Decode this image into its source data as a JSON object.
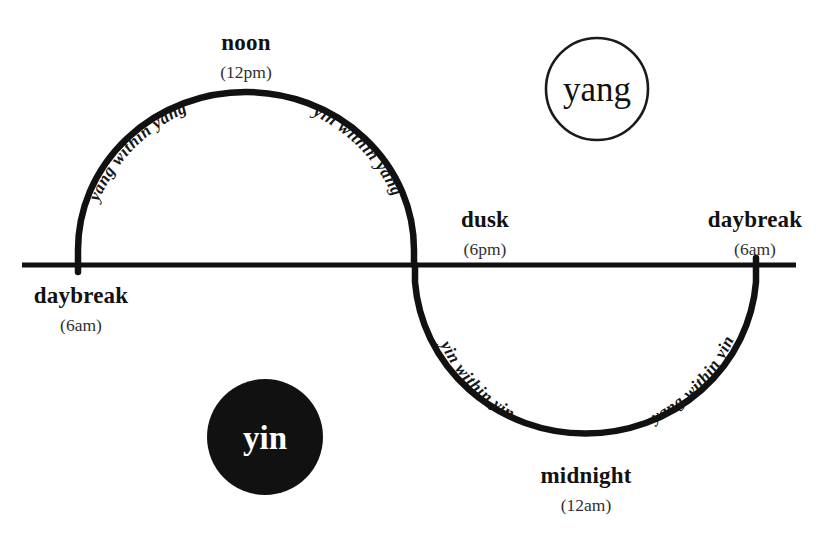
{
  "diagram": {
    "colors": {
      "stroke": "#111111",
      "background": "#ffffff",
      "yin_fill": "#111111",
      "yin_text": "#ffffff",
      "yang_fill": "#ffffff",
      "yang_text": "#111111"
    },
    "axis": {
      "name": "horizon-line",
      "x1": 22,
      "x2": 796,
      "y": 265,
      "thickness": 5
    },
    "wave": {
      "name": "sine-wave",
      "thickness": 6,
      "left_foot_x": 78,
      "crossing_x": 415,
      "right_foot_x": 756,
      "crest_y": 93,
      "trough_y": 446
    }
  },
  "time_markers": [
    {
      "key": "noon",
      "label": "noon",
      "time": "(12pm)",
      "x": 246,
      "label_y": 50,
      "time_y": 78,
      "anchor": "middle"
    },
    {
      "key": "dusk",
      "label": "dusk",
      "time": "(6pm)",
      "x": 485,
      "label_y": 227,
      "time_y": 255,
      "anchor": "middle"
    },
    {
      "key": "daybreak-right",
      "label": "daybreak",
      "time": "(6am)",
      "x": 755,
      "label_y": 227,
      "time_y": 255,
      "anchor": "middle"
    },
    {
      "key": "daybreak-left",
      "label": "daybreak",
      "time": "(6am)",
      "x": 81,
      "label_y": 303,
      "time_y": 331,
      "anchor": "middle"
    },
    {
      "key": "midnight",
      "label": "midnight",
      "time": "(12am)",
      "x": 586,
      "label_y": 483,
      "time_y": 511,
      "anchor": "middle"
    }
  ],
  "arc_captions": [
    {
      "key": "yang-within-yang",
      "text": "yang within yang"
    },
    {
      "key": "yin-within-yang",
      "text": "yin within yang"
    },
    {
      "key": "yin-within-yin",
      "text": "yin within yin"
    },
    {
      "key": "yang-within-yin",
      "text": "yang within yin"
    }
  ],
  "legend_circles": [
    {
      "key": "yang",
      "label": "yang",
      "cx": 597,
      "cy": 89,
      "r": 51,
      "filled": false
    },
    {
      "key": "yin",
      "label": "yin",
      "cx": 265,
      "cy": 437,
      "r": 58,
      "filled": true
    }
  ]
}
